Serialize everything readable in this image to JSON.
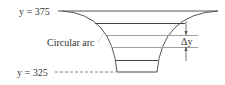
{
  "diagram": {
    "top_label": "y = 375",
    "bottom_label": "y = 325",
    "arc_label": "Circular arc",
    "delta_label": "Δy",
    "colors": {
      "stroke": "#444444",
      "light_stroke": "#a0a0a0",
      "text": "#333333",
      "background": "#ffffff"
    }
  }
}
